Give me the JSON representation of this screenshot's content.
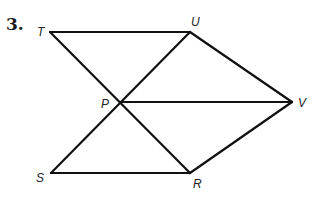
{
  "problem_number": "3.",
  "points": {
    "T": {
      "label": "T",
      "x": 50,
      "y": 32
    },
    "U": {
      "label": "U",
      "x": 190,
      "y": 32
    },
    "P": {
      "label": "P",
      "x": 120,
      "y": 102
    },
    "V": {
      "label": "V",
      "x": 292,
      "y": 102
    },
    "S": {
      "label": "S",
      "x": 51,
      "y": 173
    },
    "R": {
      "label": "R",
      "x": 190,
      "y": 173
    }
  },
  "segments": [
    [
      "T",
      "U"
    ],
    [
      "T",
      "R"
    ],
    [
      "S",
      "U"
    ],
    [
      "U",
      "V"
    ],
    [
      "P",
      "V"
    ],
    [
      "V",
      "R"
    ],
    [
      "S",
      "R"
    ]
  ]
}
